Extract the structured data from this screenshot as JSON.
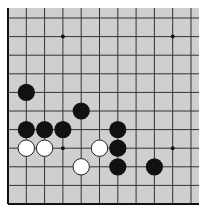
{
  "board": {
    "background": "#cfcfcf",
    "line_color": "#333333",
    "edge_color": "#111111",
    "x_lines": [
      8,
      26.3,
      44.6,
      62.9,
      81.2,
      99.5,
      117.8,
      136.1,
      154.4,
      172.7,
      191
    ],
    "y_lines": [
      18,
      36.6,
      55.2,
      73.8,
      92.4,
      111,
      129.6,
      148.2,
      166.8,
      185.4,
      204
    ],
    "left_edge": 8,
    "bottom_edge": 204,
    "right_extent": 199,
    "top_extent": 8,
    "star_points": [
      {
        "col": 3,
        "row": 1
      },
      {
        "col": 9,
        "row": 1
      },
      {
        "col": 3,
        "row": 7
      },
      {
        "col": 9,
        "row": 7
      }
    ],
    "stones": [
      {
        "color": "black",
        "col": 1,
        "row": 4
      },
      {
        "color": "black",
        "col": 4,
        "row": 5
      },
      {
        "color": "black",
        "col": 1,
        "row": 6
      },
      {
        "color": "black",
        "col": 2,
        "row": 6
      },
      {
        "color": "black",
        "col": 3,
        "row": 6
      },
      {
        "color": "black",
        "col": 6,
        "row": 6
      },
      {
        "color": "white",
        "col": 1,
        "row": 7
      },
      {
        "color": "white",
        "col": 2,
        "row": 7
      },
      {
        "color": "white",
        "col": 5,
        "row": 7
      },
      {
        "color": "black",
        "col": 6,
        "row": 7
      },
      {
        "color": "white",
        "col": 4,
        "row": 8
      },
      {
        "color": "black",
        "col": 6,
        "row": 8
      },
      {
        "color": "black",
        "col": 8,
        "row": 8
      }
    ]
  }
}
